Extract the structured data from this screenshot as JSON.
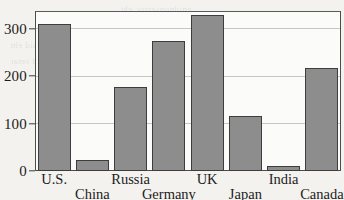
{
  "chart_data": {
    "type": "bar",
    "title": "",
    "subtitle": "",
    "xlabel": "",
    "ylabel": "",
    "categories": [
      "U.S.",
      "China",
      "Russia",
      "Germany",
      "UK",
      "Japan",
      "India",
      "Canada"
    ],
    "values": [
      310,
      23,
      178,
      274,
      329,
      116,
      10,
      217
    ],
    "ylim": [
      0,
      337
    ],
    "yticks": [
      0,
      100,
      200,
      300
    ],
    "ytick_labels": [
      "0",
      "100",
      "200",
      "300"
    ],
    "grid": true,
    "grid_axis": "y",
    "legend": "none",
    "bar_color": "#8d8d8d",
    "bar_edge_color": "#3d3d3d",
    "frame_color": "#4d4d4d",
    "label_rows": [
      "top",
      "bottom",
      "top",
      "bottom",
      "top",
      "bottom",
      "top",
      "bottom"
    ]
  },
  "figure": {
    "background": "#f3f2ef",
    "plot_background": "#fbfbfa"
  }
}
